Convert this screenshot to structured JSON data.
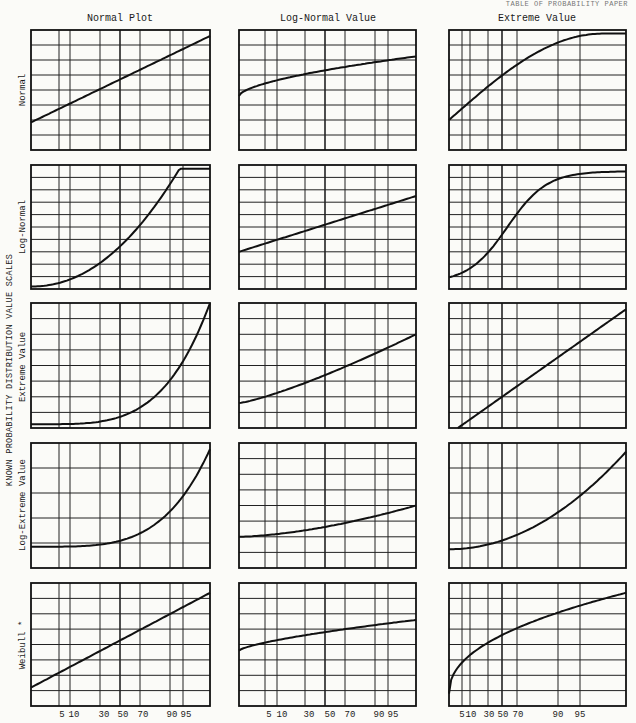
{
  "header": {
    "corner_text": "TABLE OF PROBABILITY PAPER"
  },
  "side_title": "KNOWN PROBABILITY DISTRIBUTION VALUE SCALES",
  "columns": [
    {
      "title": "Normal Plot"
    },
    {
      "title": "Log-Normal Value"
    },
    {
      "title": "Extreme Value"
    }
  ],
  "rows": [
    {
      "label": "Normal"
    },
    {
      "label": "Log-Normal"
    },
    {
      "label": "Extreme Value"
    },
    {
      "label": "Log-Extreme Value"
    },
    {
      "label": "Weibull *"
    }
  ],
  "x_ticks": {
    "labels": [
      "5",
      "10",
      "30",
      "50",
      "70",
      "90",
      "95"
    ],
    "right_column_labels": [
      "5",
      "10",
      "30",
      "50",
      "70",
      "90",
      "95"
    ]
  },
  "chart_data": {
    "type": "line",
    "xlabel": "Cumulative probability (%)",
    "ylabel": "Known probability distribution value scales",
    "x_ticks": [
      5,
      10,
      30,
      50,
      70,
      90,
      95
    ],
    "grid": true,
    "panels": [
      {
        "row": "Normal",
        "col": "Normal Plot",
        "shape": "straight line"
      },
      {
        "row": "Normal",
        "col": "Log-Normal Value",
        "shape": "concave, flattening"
      },
      {
        "row": "Normal",
        "col": "Extreme Value",
        "shape": "concave, saturating"
      },
      {
        "row": "Log-Normal",
        "col": "Normal Plot",
        "shape": "convex, steep rise"
      },
      {
        "row": "Log-Normal",
        "col": "Log-Normal Value",
        "shape": "straight line"
      },
      {
        "row": "Log-Normal",
        "col": "Extreme Value",
        "shape": "S-curve"
      },
      {
        "row": "Extreme Value",
        "col": "Normal Plot",
        "shape": "convex, exponential"
      },
      {
        "row": "Extreme Value",
        "col": "Log-Normal Value",
        "shape": "slightly convex"
      },
      {
        "row": "Extreme Value",
        "col": "Extreme Value",
        "shape": "straight line"
      },
      {
        "row": "Log-Extreme Value",
        "col": "Normal Plot",
        "shape": "convex, exponential"
      },
      {
        "row": "Log-Extreme Value",
        "col": "Log-Normal Value",
        "shape": "slightly convex"
      },
      {
        "row": "Log-Extreme Value",
        "col": "Extreme Value",
        "shape": "convex"
      },
      {
        "row": "Weibull *",
        "col": "Normal Plot",
        "shape": "straight line"
      },
      {
        "row": "Weibull *",
        "col": "Log-Normal Value",
        "shape": "slightly concave"
      },
      {
        "row": "Weibull *",
        "col": "Extreme Value",
        "shape": "concave"
      }
    ]
  }
}
